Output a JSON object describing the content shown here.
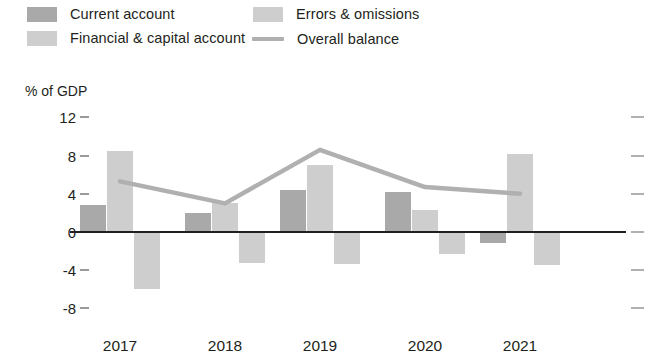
{
  "legend": {
    "items": [
      {
        "label": "Current  account",
        "type": "swatch",
        "color": "#a9a9a9"
      },
      {
        "label": "Financial & capital account",
        "type": "swatch",
        "color": "#cecece"
      },
      {
        "label": "Errors & omissions",
        "type": "swatch",
        "color": "#cecece"
      },
      {
        "label": "Overall balance",
        "type": "line",
        "color": "#b0b0b0"
      }
    ]
  },
  "chart_data": {
    "type": "bar",
    "title": "",
    "subtitle": "",
    "xlabel": "",
    "ylabel": "% of GDP",
    "axis_title": "% of GDP",
    "categories": [
      "2017",
      "2018",
      "2019",
      "2020",
      "2021"
    ],
    "ylim": [
      -8,
      12
    ],
    "yticks": [
      12,
      8,
      4,
      0,
      -4,
      -8
    ],
    "ytick_labels": [
      "12",
      "8",
      "4",
      "0",
      "-4",
      "-8"
    ],
    "grid": false,
    "legend_position": "top",
    "series": [
      {
        "name": "Current account",
        "kind": "bar",
        "color": "#a9a9a9",
        "values": [
          2.8,
          2.0,
          4.4,
          4.2,
          -1.2
        ]
      },
      {
        "name": "Financial & capital account",
        "kind": "bar",
        "color": "#cecece",
        "values": [
          8.5,
          3.0,
          7.0,
          2.3,
          8.2
        ]
      },
      {
        "name": "Errors & omissions",
        "kind": "bar",
        "color": "#cecece",
        "values": [
          -6.0,
          -3.2,
          -3.4,
          -2.3,
          -3.5
        ]
      },
      {
        "name": "Overall balance",
        "kind": "line",
        "color": "#b0b0b0",
        "values": [
          5.3,
          3.0,
          8.6,
          4.7,
          4.0
        ]
      }
    ]
  }
}
